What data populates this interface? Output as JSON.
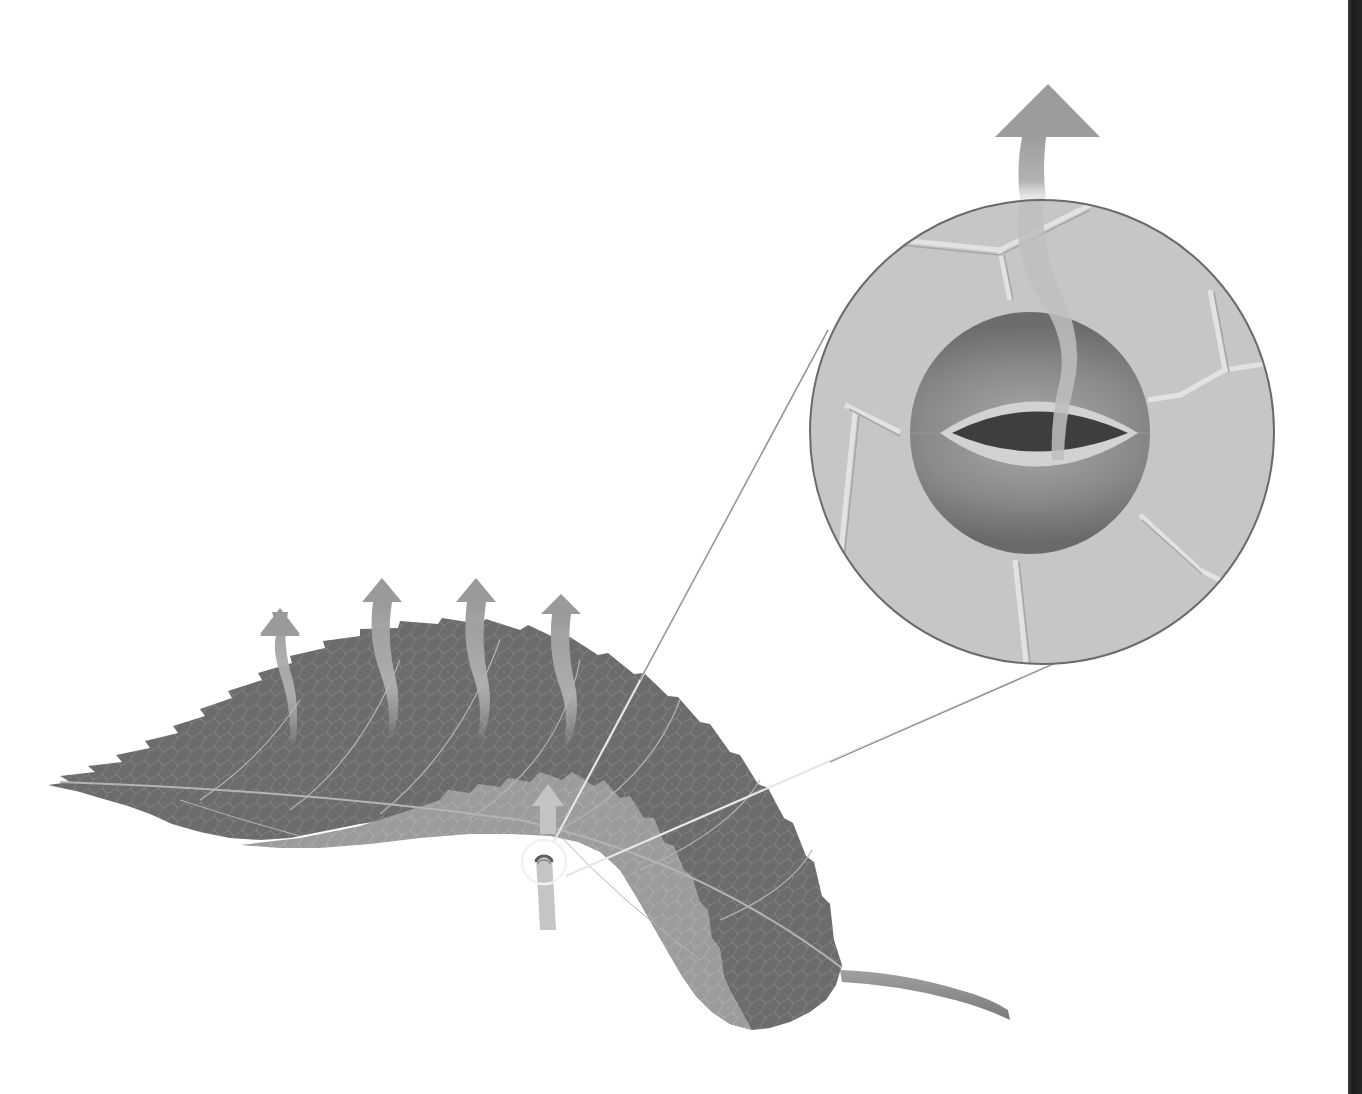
{
  "figure": {
    "title": "Leaf transpiration through a stoma",
    "style": "grayscale illustration",
    "text_labels": []
  },
  "colors": {
    "background": "#ffffff",
    "leaf_upper": "#6e6e6e",
    "leaf_underside": "#9a9a9a",
    "leaf_veins": "#b8b8b8",
    "arrow": "#a8a8a8",
    "magnifier_fill": "#c6c6c6",
    "magnifier_border": "#6a6a6a",
    "cell_wall_highlight": "#dedede",
    "guard_cell": "#808080",
    "guard_cell_rim": "#d4d4d4",
    "pore": "#3c3c3c",
    "zoom_lines": "#8a8a8a",
    "stoma_marker": "#f0f0f0",
    "edge_band": "#222222"
  },
  "elements": {
    "leaf": {
      "name": "serrated leaf",
      "orientation": "tip at left, petiole at lower right"
    },
    "transpiration_arrows": {
      "count": 4,
      "direction": "up",
      "shape": "wavy"
    },
    "stoma_marker": {
      "shape": "circle",
      "on": "leaf underside",
      "has_arrow": true
    },
    "magnified_view": {
      "shape": "circle",
      "shows": [
        "epidermal cells",
        "guard cells",
        "stomatal pore",
        "water vapor arrow"
      ]
    },
    "exit_arrow": {
      "direction": "up",
      "from": "stomatal pore"
    }
  }
}
